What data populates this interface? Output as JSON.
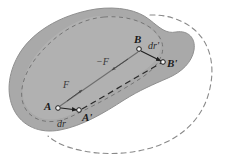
{
  "figure": {
    "background_color": "#ffffff"
  },
  "colors": {
    "body_fill": "#a9a9a9",
    "body_inner_fill": "#b8b8b8",
    "body_edge": "#8f8f8f",
    "inner_dashed_edge": "#707070",
    "displaced_outline": "#8a8a8a",
    "solid_connector": "#6e6e6e",
    "dashed_connector": "#2a2a2a",
    "arrow": "#1f1f1f",
    "marker_fill": "#f2f2f2",
    "marker_stroke": "#1a1a1a",
    "label_text": "#1a1a1a"
  },
  "points": [
    {
      "id": "A",
      "label": "A",
      "x": 58,
      "y": 108,
      "label_x": 44,
      "label_y": 101
    },
    {
      "id": "Aprime",
      "label": "A'",
      "x": 79,
      "y": 110,
      "label_x": 82,
      "label_y": 112
    },
    {
      "id": "B",
      "label": "B",
      "x": 139,
      "y": 49,
      "label_x": 134,
      "label_y": 34
    },
    {
      "id": "Bprime",
      "label": "B'",
      "x": 163,
      "y": 62,
      "label_x": 167,
      "label_y": 58
    }
  ],
  "vectors": [
    {
      "id": "dr",
      "label": "dr",
      "from": "A",
      "to": "Aprime",
      "label_x": 57,
      "label_y": 119,
      "description": "displacement of point A"
    },
    {
      "id": "drprime",
      "label": "dr'",
      "from": "B",
      "to": "Bprime",
      "label_x": 148,
      "label_y": 41,
      "description": "displacement of point B"
    }
  ],
  "forces": [
    {
      "id": "F",
      "label": "F",
      "label_x": 63,
      "label_y": 80,
      "description": "internal force acting at A along AB"
    },
    {
      "id": "minusF",
      "label": "−F",
      "label_x": 96,
      "label_y": 57,
      "description": "reaction force acting at B along BA"
    }
  ],
  "connectors": [
    {
      "id": "AB",
      "style": "solid",
      "from": "A",
      "to": "B",
      "description": "original line element between A and B"
    },
    {
      "id": "ApBp",
      "style": "dashed",
      "from": "Aprime",
      "to": "Bprime",
      "description": "displaced line element between A' and B'"
    }
  ],
  "shapes": {
    "body_outline": {
      "name": "undeformed-body",
      "style": "filled-gray-blob"
    },
    "body_inner_ellipse": {
      "name": "inner-region",
      "style": "dashed-ellipse"
    },
    "displaced_body_outline": {
      "name": "displaced-body",
      "style": "dashed-outline"
    }
  }
}
